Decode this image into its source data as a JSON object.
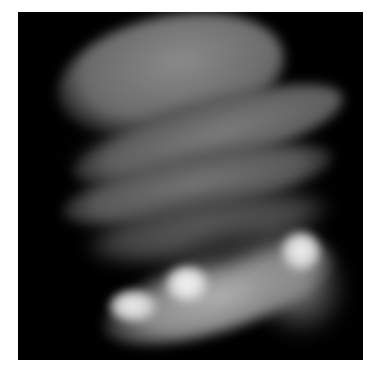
{
  "image": {
    "description": "Grayscale telescope image of a banded gas giant planet (Jupiter-like) with bright impact-like spots in the southern hemisphere",
    "background_color": "#000000",
    "page_background": "#ffffff",
    "features": [
      {
        "name": "north-cap",
        "tone": "#7a7a7a"
      },
      {
        "name": "band-1",
        "tone": "#6e6e6e"
      },
      {
        "name": "band-2",
        "tone": "#727272"
      },
      {
        "name": "band-3",
        "tone": "#666666"
      },
      {
        "name": "south-crescent",
        "tone": "#a8a8a8"
      },
      {
        "name": "bright-spot-center",
        "tone": "#f2f2f2"
      },
      {
        "name": "bright-spot-left",
        "tone": "#e8e8e8"
      },
      {
        "name": "bright-spot-right",
        "tone": "#eeeeee"
      }
    ]
  }
}
